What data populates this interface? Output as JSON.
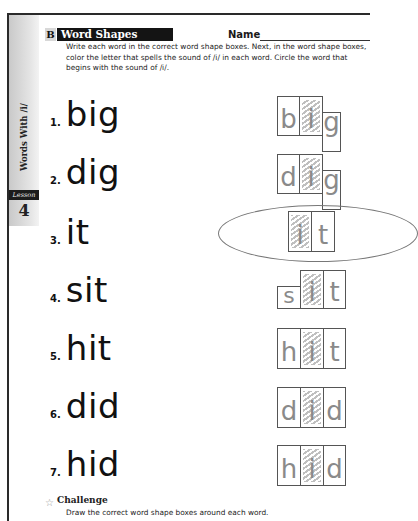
{
  "side_tab": {
    "title": "Words With /i/",
    "lesson_label": "Lesson",
    "lesson_number": "4"
  },
  "section": {
    "letter": "B",
    "title": "Word Shapes",
    "name_label": "Name"
  },
  "instructions": "Write each word in the correct word shape boxes. Next, in the word shape boxes, color the letter that spells the sound of /i/ in each word. Circle the word that begins with the sound of /i/.",
  "items": [
    {
      "number": "1.",
      "word": "big",
      "letters": [
        "b",
        "i",
        "g"
      ]
    },
    {
      "number": "2.",
      "word": "dig",
      "letters": [
        "d",
        "i",
        "g"
      ]
    },
    {
      "number": "3.",
      "word": "it",
      "letters": [
        "i",
        "t"
      ],
      "circled": true
    },
    {
      "number": "4.",
      "word": "sit",
      "letters": [
        "s",
        "i",
        "t"
      ]
    },
    {
      "number": "5.",
      "word": "hit",
      "letters": [
        "h",
        "i",
        "t"
      ]
    },
    {
      "number": "6.",
      "word": "did",
      "letters": [
        "d",
        "i",
        "d"
      ]
    },
    {
      "number": "7.",
      "word": "hid",
      "letters": [
        "h",
        "i",
        "d"
      ]
    }
  ],
  "challenge": {
    "title": "Challenge",
    "text": "Draw the correct word shape boxes around each word."
  },
  "colors": {
    "rule": "#2a2a2a",
    "header_bg": "#141414",
    "box_border": "#555555",
    "coloring": "#aaaaaa",
    "circle": "#777777"
  }
}
